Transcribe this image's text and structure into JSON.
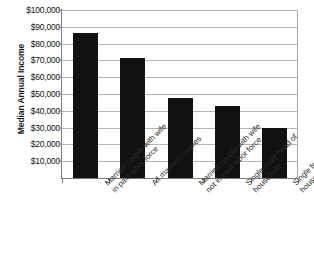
{
  "chart_data": {
    "type": "bar",
    "title": "",
    "xlabel": "",
    "ylabel": "Median Annual Income",
    "categories": [
      "Married couple with wife in paid labor force",
      "All married couples",
      "Married couple with wife not in paid labor force",
      "Single male head of household",
      "Single female head of household"
    ],
    "category_lines": [
      [
        "Married couple with wife",
        "in paid labor force"
      ],
      [
        "All married couples",
        ""
      ],
      [
        "Married couple with wife",
        "not in paid labor force"
      ],
      [
        "Single male head of",
        "household"
      ],
      [
        "Single female head of",
        "household"
      ]
    ],
    "values": [
      86500,
      71500,
      47500,
      43000,
      29500
    ],
    "ylim": [
      0,
      100000
    ],
    "ytick_values": [
      10000,
      20000,
      30000,
      40000,
      50000,
      60000,
      70000,
      80000,
      90000,
      100000
    ],
    "ytick_labels": [
      "$10,000",
      "$20,000",
      "$30,000",
      "$40,000",
      "$50,000",
      "$60,000",
      "$70,000",
      "$80,000",
      "$90,000",
      "$100,000"
    ],
    "grid": true,
    "legend": false,
    "bar_color": "#111111",
    "grid_color": "#b5b5b5",
    "axis_color": "#7d7d7d"
  }
}
